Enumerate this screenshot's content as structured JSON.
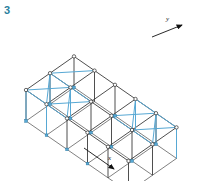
{
  "figure": {
    "number": "3",
    "number_color": "#2a7f9e",
    "caption": ""
  },
  "canvas": {
    "width": 200,
    "height": 181,
    "background": "#ffffff"
  },
  "diagram": {
    "type": "isometric-structural-frame",
    "frame_color": "#3b3b3b",
    "brace_color": "#57a8d4",
    "node_fill": "#ffffff",
    "node_stroke": "#2b2b2b",
    "bays_x": 5,
    "bays_y": 2,
    "storeys": 1
  },
  "axes": [
    {
      "name": "y-axis",
      "label": "y",
      "arrow_direction": "up-right",
      "label_x": 167,
      "label_y": 20,
      "arrow_from": [
        150,
        38
      ],
      "arrow_to": [
        183,
        25
      ]
    },
    {
      "name": "x-axis",
      "label": "x",
      "arrow_direction": "down-right",
      "label_x": 110,
      "label_y": 160,
      "arrow_from": [
        84,
        148
      ],
      "arrow_to": [
        117,
        171
      ]
    }
  ],
  "geometry": {
    "comment": "Isometric projection vectors in pixels",
    "origin": [
      26,
      121
    ],
    "x_step": [
      20.5,
      14.2
    ],
    "y_step": [
      24.0,
      -16.8
    ],
    "column_height": 31
  },
  "braced_bays": {
    "roof_plane": [
      {
        "name": "roof-brace-near-left",
        "ix": 0,
        "iy": 0
      },
      {
        "name": "roof-brace-near-left-2",
        "ix": 1,
        "iy": 0
      },
      {
        "name": "roof-brace-far-right",
        "ix": 3,
        "iy": 1
      },
      {
        "name": "roof-brace-far-right-2",
        "ix": 4,
        "iy": 1
      }
    ],
    "vertical_plane": [
      {
        "name": "wall-brace-left-front",
        "ix": 0
      },
      {
        "name": "wall-brace-right-back",
        "ix": 4
      }
    ]
  }
}
